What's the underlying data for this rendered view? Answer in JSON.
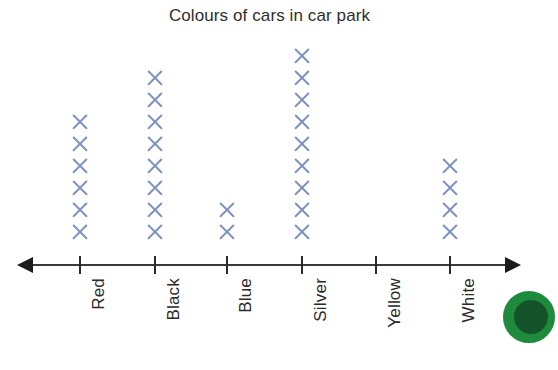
{
  "chart_data": {
    "type": "bar",
    "subtype": "pictogram-dot-plot",
    "title": "Colours of cars in car park",
    "xlabel": "",
    "ylabel": "",
    "categories": [
      "Red",
      "Black",
      "Blue",
      "Silver",
      "Yellow",
      "White"
    ],
    "values": [
      6,
      8,
      2,
      9,
      0,
      4
    ],
    "ylim": [
      0,
      9
    ],
    "grid": false,
    "legend": null,
    "marker": "X",
    "marker_color": "#7e93bf",
    "axis_color": "#2b2b2b",
    "title_color": "#2e2e2e"
  },
  "decoration": {
    "badge_color": "#1e8a3c",
    "badge_inner_color": "#14532a",
    "badge_name": "green-circle-badge"
  }
}
